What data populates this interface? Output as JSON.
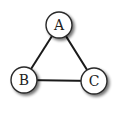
{
  "diagram": {
    "type": "undirected-graph",
    "nodes": [
      {
        "id": "A",
        "label": "A",
        "cx": 59,
        "cy": 25
      },
      {
        "id": "B",
        "label": "B",
        "cx": 24,
        "cy": 80
      },
      {
        "id": "C",
        "label": "C",
        "cx": 94,
        "cy": 81
      }
    ],
    "edges": [
      {
        "from": "A",
        "to": "B"
      },
      {
        "from": "A",
        "to": "C"
      },
      {
        "from": "B",
        "to": "C"
      }
    ],
    "style": {
      "edge_color": "#1a1a1a",
      "node_fill": "#ffffff",
      "node_stroke": "#2a2a2a",
      "node_radius": 13
    }
  }
}
